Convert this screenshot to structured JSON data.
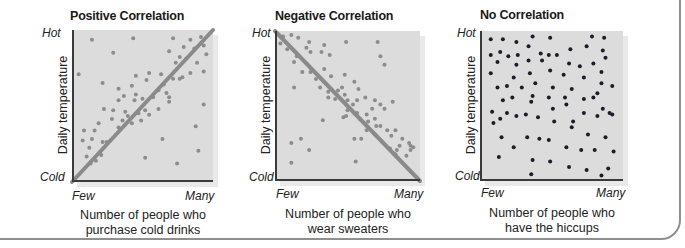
{
  "colors": {
    "plot_bg": "#dcdcdc",
    "gray_dot": "#8c8c8c",
    "trend_line": "#8a8a8a",
    "dark_dot": "#1c1c2a",
    "axis": "#3a3a3a",
    "frame": "#8f8f8f"
  },
  "chart_data": [
    {
      "type": "scatter",
      "title": "Positive Correlation",
      "xlabel": "Number of people who purchase cold drinks",
      "xlabel_lines": [
        "Number of people who",
        "purchase cold drinks"
      ],
      "ylabel": "Daily temperature",
      "x_tick_labels": [
        "Few",
        "Many"
      ],
      "y_tick_labels": [
        "Cold",
        "Hot"
      ],
      "xlim": [
        0,
        100
      ],
      "ylim": [
        0,
        100
      ],
      "grid": false,
      "trend_line": {
        "from": [
          0,
          0
        ],
        "to": [
          100,
          100
        ]
      },
      "dot_color": "#8c8c8c",
      "points": [
        [
          12,
          96
        ],
        [
          43,
          97
        ],
        [
          73,
          97
        ],
        [
          86,
          96
        ],
        [
          94,
          98
        ],
        [
          96,
          92
        ],
        [
          89,
          90
        ],
        [
          81,
          91
        ],
        [
          70,
          88
        ],
        [
          28,
          87
        ],
        [
          91,
          80
        ],
        [
          98,
          86
        ],
        [
          83,
          83
        ],
        [
          78,
          84
        ],
        [
          75,
          80
        ],
        [
          96,
          74
        ],
        [
          86,
          73
        ],
        [
          64,
          72
        ],
        [
          55,
          73
        ],
        [
          45,
          71
        ],
        [
          32,
          62
        ],
        [
          20,
          66
        ],
        [
          2,
          72
        ],
        [
          80,
          70
        ],
        [
          78,
          69
        ],
        [
          73,
          69
        ],
        [
          66,
          65
        ],
        [
          53,
          68
        ],
        [
          42,
          64
        ],
        [
          62,
          61
        ],
        [
          68,
          59
        ],
        [
          45,
          58
        ],
        [
          36,
          57
        ],
        [
          50,
          55
        ],
        [
          32,
          54
        ],
        [
          44,
          54
        ],
        [
          58,
          56
        ],
        [
          70,
          56
        ],
        [
          70,
          53
        ],
        [
          96,
          51
        ],
        [
          62,
          48
        ],
        [
          52,
          47
        ],
        [
          55,
          44
        ],
        [
          47,
          45
        ],
        [
          37,
          46
        ],
        [
          28,
          47
        ],
        [
          21,
          48
        ],
        [
          27,
          41
        ],
        [
          35,
          40
        ],
        [
          39,
          43
        ],
        [
          42,
          38
        ],
        [
          49,
          40
        ],
        [
          32,
          35
        ],
        [
          17,
          38
        ],
        [
          14,
          33
        ],
        [
          6,
          33
        ],
        [
          5,
          26
        ],
        [
          12,
          27
        ],
        [
          20,
          25
        ],
        [
          23,
          25
        ],
        [
          10,
          21
        ],
        [
          18,
          18
        ],
        [
          19,
          16
        ],
        [
          15,
          12
        ],
        [
          8,
          15
        ],
        [
          11,
          10
        ],
        [
          65,
          27
        ],
        [
          90,
          36
        ],
        [
          76,
          10
        ],
        [
          92,
          19
        ],
        [
          52,
          14
        ]
      ]
    },
    {
      "type": "scatter",
      "title": "Negative Correlation",
      "xlabel": "Number of people who wear sweaters",
      "xlabel_lines": [
        "Number of people who",
        "wear sweaters"
      ],
      "ylabel": "Daily temperature",
      "x_tick_labels": [
        "Few",
        "Many"
      ],
      "y_tick_labels": [
        "Cold",
        "Hot"
      ],
      "xlim": [
        0,
        100
      ],
      "ylim": [
        0,
        100
      ],
      "grid": false,
      "trend_line": {
        "from": [
          0,
          100
        ],
        "to": [
          100,
          0
        ]
      },
      "dot_color": "#8c8c8c",
      "points": [
        [
          3,
          99
        ],
        [
          9,
          100
        ],
        [
          14,
          98
        ],
        [
          22,
          95
        ],
        [
          1,
          94
        ],
        [
          6,
          90
        ],
        [
          20,
          91
        ],
        [
          33,
          93
        ],
        [
          49,
          95
        ],
        [
          31,
          88
        ],
        [
          23,
          88
        ],
        [
          13,
          85
        ],
        [
          37,
          86
        ],
        [
          11,
          81
        ],
        [
          17,
          74
        ],
        [
          23,
          74
        ],
        [
          33,
          76
        ],
        [
          38,
          71
        ],
        [
          48,
          72
        ],
        [
          55,
          67
        ],
        [
          11,
          63
        ],
        [
          27,
          69
        ],
        [
          30,
          63
        ],
        [
          36,
          60
        ],
        [
          43,
          61
        ],
        [
          46,
          63
        ],
        [
          48,
          58
        ],
        [
          58,
          62
        ],
        [
          63,
          56
        ],
        [
          45,
          55
        ],
        [
          36,
          56
        ],
        [
          41,
          55
        ],
        [
          50,
          54
        ],
        [
          57,
          54
        ],
        [
          70,
          54
        ],
        [
          74,
          51
        ],
        [
          83,
          53
        ],
        [
          77,
          48
        ],
        [
          68,
          48
        ],
        [
          64,
          44
        ],
        [
          55,
          45
        ],
        [
          50,
          47
        ],
        [
          49,
          43
        ],
        [
          57,
          45
        ],
        [
          59,
          41
        ],
        [
          65,
          39
        ],
        [
          71,
          36
        ],
        [
          74,
          36
        ],
        [
          79,
          33
        ],
        [
          85,
          33
        ],
        [
          82,
          29
        ],
        [
          70,
          41
        ],
        [
          64,
          33
        ],
        [
          70,
          30
        ],
        [
          60,
          27
        ],
        [
          55,
          27
        ],
        [
          90,
          27
        ],
        [
          96,
          22
        ],
        [
          88,
          22
        ],
        [
          95,
          24
        ],
        [
          81,
          20
        ],
        [
          86,
          19
        ],
        [
          96,
          19
        ],
        [
          85,
          16
        ],
        [
          93,
          15
        ],
        [
          98,
          21
        ],
        [
          16,
          27
        ],
        [
          32,
          40
        ],
        [
          47,
          42
        ],
        [
          54,
          51
        ],
        [
          72,
          95
        ],
        [
          77,
          79
        ],
        [
          74,
          85
        ],
        [
          9,
          24
        ],
        [
          22,
          19
        ],
        [
          9,
          10
        ],
        [
          56,
          11
        ]
      ]
    },
    {
      "type": "scatter",
      "title": "No Correlation",
      "xlabel": "Number of people who have the hiccups",
      "xlabel_lines": [
        "Number of people who",
        "have the hiccups"
      ],
      "ylabel": "Daily temperature",
      "x_tick_labels": [
        "Few",
        "Many"
      ],
      "y_tick_labels": [
        "Cold",
        "Hot"
      ],
      "xlim": [
        0,
        100
      ],
      "ylim": [
        0,
        100
      ],
      "grid": false,
      "trend_line": null,
      "dot_color": "#1c1c2a",
      "points": [
        [
          5,
          97
        ],
        [
          14,
          97
        ],
        [
          24,
          95
        ],
        [
          36,
          99
        ],
        [
          49,
          98
        ],
        [
          80,
          99
        ],
        [
          89,
          98
        ],
        [
          33,
          92
        ],
        [
          12,
          88
        ],
        [
          42,
          87
        ],
        [
          64,
          90
        ],
        [
          76,
          92
        ],
        [
          88,
          89
        ],
        [
          5,
          86
        ],
        [
          18,
          85
        ],
        [
          25,
          86
        ],
        [
          48,
          86
        ],
        [
          54,
          86
        ],
        [
          90,
          84
        ],
        [
          10,
          81
        ],
        [
          24,
          79
        ],
        [
          33,
          82
        ],
        [
          43,
          82
        ],
        [
          63,
          80
        ],
        [
          71,
          78
        ],
        [
          81,
          80
        ],
        [
          5,
          73
        ],
        [
          22,
          70
        ],
        [
          34,
          73
        ],
        [
          49,
          75
        ],
        [
          59,
          72
        ],
        [
          74,
          70
        ],
        [
          87,
          74
        ],
        [
          38,
          66
        ],
        [
          10,
          63
        ],
        [
          17,
          64
        ],
        [
          28,
          63
        ],
        [
          51,
          63
        ],
        [
          65,
          62
        ],
        [
          87,
          66
        ],
        [
          95,
          64
        ],
        [
          36,
          57
        ],
        [
          84,
          59
        ],
        [
          14,
          54
        ],
        [
          21,
          56
        ],
        [
          35,
          53
        ],
        [
          48,
          56
        ],
        [
          60,
          56
        ],
        [
          74,
          55
        ],
        [
          81,
          56
        ],
        [
          6,
          46
        ],
        [
          88,
          48
        ],
        [
          93,
          45
        ],
        [
          51,
          48
        ],
        [
          61,
          51
        ],
        [
          12,
          41
        ],
        [
          17,
          45
        ],
        [
          24,
          43
        ],
        [
          31,
          44
        ],
        [
          40,
          42
        ],
        [
          52,
          39
        ],
        [
          66,
          39
        ],
        [
          74,
          45
        ],
        [
          84,
          43
        ],
        [
          95,
          44
        ],
        [
          7,
          38
        ],
        [
          65,
          35
        ],
        [
          77,
          30
        ],
        [
          90,
          28
        ],
        [
          13,
          28
        ],
        [
          32,
          28
        ],
        [
          41,
          27
        ],
        [
          48,
          26
        ],
        [
          61,
          21
        ],
        [
          72,
          19
        ],
        [
          82,
          19
        ],
        [
          96,
          18
        ],
        [
          11,
          14
        ],
        [
          22,
          21
        ],
        [
          36,
          12
        ],
        [
          49,
          11
        ],
        [
          63,
          7
        ],
        [
          76,
          5
        ],
        [
          92,
          6
        ],
        [
          35,
          2
        ],
        [
          87,
          1
        ]
      ]
    }
  ],
  "panels": [
    {
      "title": "Positive Correlation",
      "y_hot": "Hot",
      "y_cold": "Cold",
      "y_title": "Daily temperature",
      "x_few": "Few",
      "x_many": "Many",
      "x_title_1": "Number of people who",
      "x_title_2": "purchase cold drinks"
    },
    {
      "title": "Negative Correlation",
      "y_hot": "Hot",
      "y_cold": "Cold",
      "y_title": "Daily temperature",
      "x_few": "Few",
      "x_many": "Many",
      "x_title_1": "Number of people who",
      "x_title_2": "wear sweaters"
    },
    {
      "title": "No Correlation",
      "y_hot": "Hot",
      "y_cold": "Cold",
      "y_title": "Daily temperature",
      "x_few": "Few",
      "x_many": "Many",
      "x_title_1": "Number of people who",
      "x_title_2": "have the hiccups"
    }
  ]
}
